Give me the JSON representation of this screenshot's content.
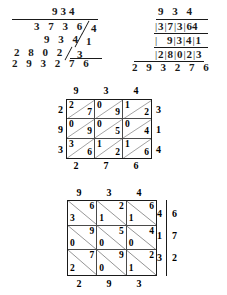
{
  "document": {
    "title": "Lattice and long multiplication of 934 by 314",
    "kind": "math-worksheet-figure"
  },
  "figures": {
    "long_multiplication_slashed": {
      "name": "long-multiplication-with-slashes",
      "multiplicand": "934",
      "partial_rows": [
        {
          "digits": "3 7 3 6",
          "carry": "4"
        },
        {
          "digits": "9 3 4",
          "carry": "1"
        },
        {
          "digits": "2 8 0 2",
          "carry": "3"
        }
      ],
      "product": "2 9 3 2 7 6"
    },
    "long_multiplication_boxed": {
      "name": "long-multiplication-with-boxes",
      "multiplicand": "9 3 4",
      "partial_rows": [
        {
          "boxed": [
            "3",
            "7",
            "3",
            "6"
          ],
          "outside": "4"
        },
        {
          "boxed": [
            "",
            "9",
            "3",
            "4"
          ],
          "outside": "1"
        },
        {
          "boxed": [
            "2",
            "8",
            "0",
            "2"
          ],
          "outside": "3"
        }
      ],
      "product": "2 9 3 2 7 6"
    },
    "lattice_top": {
      "name": "lattice-grid-diagonal-up",
      "diagonal": "up",
      "top_labels": [
        "9",
        "3",
        "4"
      ],
      "right_labels": [
        "3",
        "1",
        "4"
      ],
      "left_labels": [
        "2",
        "9",
        "3"
      ],
      "bottom_labels": [
        "2",
        "7",
        "6"
      ],
      "cells": [
        [
          {
            "hi": "2",
            "lo": "7"
          },
          {
            "hi": "0",
            "lo": "9"
          },
          {
            "hi": "1",
            "lo": "2"
          }
        ],
        [
          {
            "hi": "0",
            "lo": "9"
          },
          {
            "hi": "0",
            "lo": "5"
          },
          {
            "hi": "0",
            "lo": "4"
          }
        ],
        [
          {
            "hi": "3",
            "lo": "6"
          },
          {
            "hi": "1",
            "lo": "2"
          },
          {
            "hi": "1",
            "lo": "6"
          }
        ]
      ]
    },
    "lattice_bottom": {
      "name": "lattice-grid-diagonal-down",
      "diagonal": "down",
      "top_labels": [
        "9",
        "3",
        "4"
      ],
      "right_inner_labels": [
        "4",
        "1",
        "3"
      ],
      "right_outer_labels": [
        "6",
        "7",
        "2"
      ],
      "bottom_labels": [
        "2",
        "9",
        "3"
      ],
      "cells": [
        [
          {
            "hi": "6",
            "lo": "3"
          },
          {
            "hi": "2",
            "lo": "1"
          },
          {
            "hi": "6",
            "lo": "1"
          }
        ],
        [
          {
            "hi": "9",
            "lo": "0"
          },
          {
            "hi": "5",
            "lo": "0"
          },
          {
            "hi": "4",
            "lo": "0"
          }
        ],
        [
          {
            "hi": "7",
            "lo": "2"
          },
          {
            "hi": "9",
            "lo": "0"
          },
          {
            "hi": "2",
            "lo": "1"
          }
        ]
      ]
    }
  },
  "colors": {
    "ink": "#1a1a1a",
    "paper": "#ffffff",
    "rule": "#4a4a4a"
  }
}
